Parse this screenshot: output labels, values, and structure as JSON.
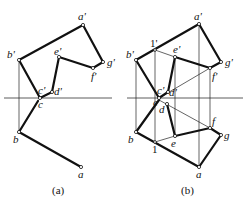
{
  "figure_a": {
    "caption": "(a)",
    "labels": {
      "a_prime": "a'",
      "b_prime": "b'",
      "c_prime": "c'",
      "d_prime": "d'",
      "e_prime": "e'",
      "f_prime": "f'",
      "g_prime": "g'",
      "a": "a",
      "b": "b",
      "c": "c"
    }
  },
  "figure_b": {
    "caption": "(b)",
    "labels": {
      "a_prime": "a'",
      "b_prime": "b'",
      "c_prime": "c'",
      "d_prime": "d'",
      "e_prime": "e'",
      "f_prime": "f'",
      "g_prime": "g'",
      "one_prime": "1'",
      "a": "a",
      "b": "b",
      "c": "c",
      "d": "d",
      "e": "e",
      "f": "f",
      "g": "g",
      "one": "1"
    }
  },
  "colors": {
    "line": "#111111",
    "background": "#ffffff"
  }
}
